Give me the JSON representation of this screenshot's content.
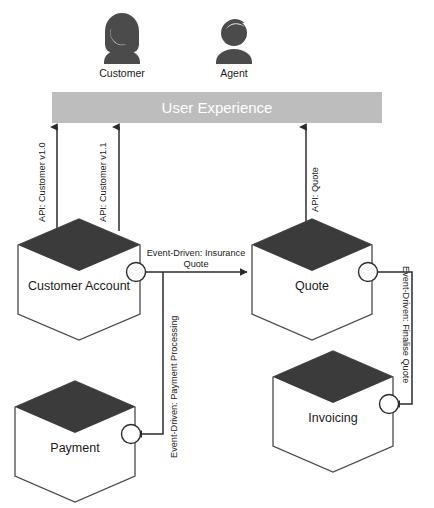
{
  "diagram": {
    "colors": {
      "dark_fill": "#3b3b3b",
      "ux_bar": "#bdbdbd",
      "stroke": "#4a4a4a",
      "text": "#1a1a1a",
      "ux_text": "#ffffff",
      "background": "#ffffff"
    },
    "actors": [
      {
        "id": "customer",
        "label": "Customer",
        "icon": "person-female-icon"
      },
      {
        "id": "agent",
        "label": "Agent",
        "icon": "person-male-icon"
      }
    ],
    "layer": {
      "label": "User Experience"
    },
    "nodes": [
      {
        "id": "customer-account",
        "label": "Customer Account"
      },
      {
        "id": "quote",
        "label": "Quote"
      },
      {
        "id": "payment",
        "label": "Payment"
      },
      {
        "id": "invoicing",
        "label": "Invoicing"
      }
    ],
    "edges": [
      {
        "id": "api-customer-v10",
        "label": "API: Customer v1.0",
        "kind": "api",
        "from": "customer-account",
        "to": "user-experience"
      },
      {
        "id": "api-customer-v11",
        "label": "API: Customer v1.1",
        "kind": "api",
        "from": "customer-account",
        "to": "user-experience"
      },
      {
        "id": "api-quote",
        "label": "API: Quote",
        "kind": "api",
        "from": "quote",
        "to": "user-experience"
      },
      {
        "id": "event-insurance-quote",
        "label": "Event-Driven: Insurance Quote",
        "label_line_1": "Event-Driven: Insurance",
        "label_line_2": "Quote",
        "kind": "event",
        "from": "customer-account",
        "to": "quote"
      },
      {
        "id": "event-payment-processing",
        "label": "Event-Driven: Payment Processing",
        "kind": "event",
        "from": "customer-account",
        "to": "payment"
      },
      {
        "id": "event-finalise-quote",
        "label": "Event-Driven: Finalise Quote",
        "kind": "event",
        "from": "quote",
        "to": "invoicing"
      }
    ]
  }
}
